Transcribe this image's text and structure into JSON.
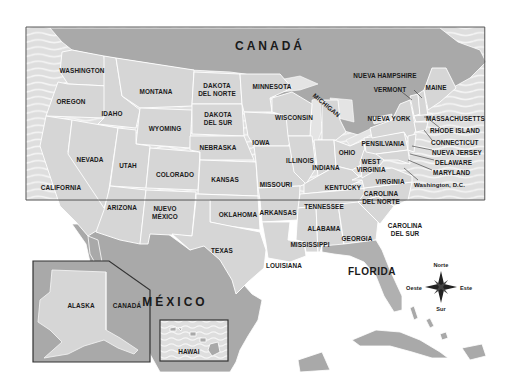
{
  "map": {
    "title": "Mapa de los Estados Unidos",
    "colors": {
      "ocean": "#e2e2e2",
      "ocean_wave": "#f4f4f4",
      "us_states": "#d6d6d6",
      "foreign_land": "#a9a9a9",
      "borders": "#ffffff",
      "labels": "#1a1a1a",
      "frame": "#555555"
    },
    "countries": {
      "canada": "CANADÁ",
      "mexico": "MÉXICO"
    },
    "states": {
      "washington": "WASHINGTON",
      "oregon": "OREGON",
      "california": "CALIFORNIA",
      "idaho": "IDAHO",
      "nevada": "NEVADA",
      "montana": "MONTANA",
      "wyoming": "WYOMING",
      "utah": "UTAH",
      "arizona": "ARIZONA",
      "colorado": "COLORADO",
      "nuevo_mexico_1": "NUEVO",
      "nuevo_mexico_2": "MÉXICO",
      "dakota_norte_1": "DAKOTA",
      "dakota_norte_2": "DEL NORTE",
      "dakota_sur_1": "DAKOTA",
      "dakota_sur_2": "DEL SUR",
      "nebraska": "NEBRASKA",
      "kansas": "KANSAS",
      "oklahoma": "OKLAHOMA",
      "texas": "TEXAS",
      "minnesota": "MINNESOTA",
      "iowa": "IOWA",
      "missouri": "MISSOURI",
      "arkansas": "ARKANSAS",
      "louisiana": "LOUISIANA",
      "wisconsin": "WISCONSIN",
      "illinois": "ILLINOIS",
      "michigan": "MICHIGAN",
      "indiana": "INDIANA",
      "ohio": "OHIO",
      "kentucky": "KENTUCKY",
      "tennessee": "TENNESSEE",
      "mississippi": "MISSISSIPPI",
      "alabama": "ALABAMA",
      "georgia": "GEORGIA",
      "florida": "FLORIDA",
      "carolina_sur_1": "CAROLINA",
      "carolina_sur_2": "DEL SUR",
      "carolina_norte_1": "CAROLINA",
      "carolina_norte_2": "DEL NORTE",
      "virginia": "VIRGINIA",
      "west_virginia_1": "WEST",
      "west_virginia_2": "VIRGINIA",
      "pensilvania": "PENSILVANIA",
      "nueva_york": "NUEVA YORK",
      "vermont": "VERMONT",
      "nueva_hampshire": "NUEVA HAMPSHIRE",
      "maine": "MAINE",
      "massachusetts": "MASSACHUSETTS",
      "rhode_island": "RHODE ISLAND",
      "connecticut": "CONNECTICUT",
      "nueva_jersey": "NUEVA JERSEY",
      "delaware": "DELAWARE",
      "maryland": "MARYLAND",
      "washington_dc": "Washington, D.C.",
      "alaska": "ALASKA",
      "hawai": "HAWAI"
    },
    "insets": {
      "alaska_canada": "CANADÁ"
    },
    "compass": {
      "north": "Norte",
      "south": "Sur",
      "east": "Este",
      "west": "Oeste",
      "icon": "compass-rose-icon"
    }
  }
}
